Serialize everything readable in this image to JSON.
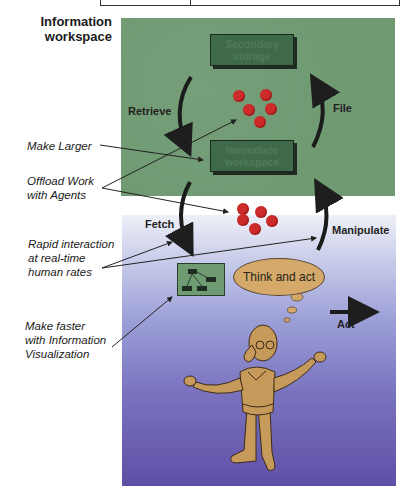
{
  "title": {
    "line1": "Information",
    "line2": "workspace"
  },
  "boxes": {
    "secondary": {
      "line1": "Secondary",
      "line2": "storage"
    },
    "immediate": {
      "line1": "Immediate",
      "line2": "workspace"
    }
  },
  "cycle_labels": {
    "retrieve": "Retrieve",
    "file": "File",
    "fetch": "Fetch",
    "manipulate": "Manipulate",
    "act": "Act"
  },
  "thought_bubble": "Think and act",
  "annotations": [
    {
      "lines": [
        "Make Larger"
      ]
    },
    {
      "lines": [
        "Offload Work",
        "with Agents"
      ]
    },
    {
      "lines": [
        "Rapid interaction",
        "at real-time",
        "human rates"
      ]
    },
    {
      "lines": [
        "Make faster",
        "with Information",
        "Visualization"
      ]
    }
  ],
  "colors": {
    "workspace_panel": "#6f9a72",
    "box_fill": "#3f6a49",
    "dots": "#d02b2b",
    "human_panel_top": "#eef0f8",
    "human_panel_bottom": "#5f4fa6",
    "figure": "#c69a5a"
  }
}
